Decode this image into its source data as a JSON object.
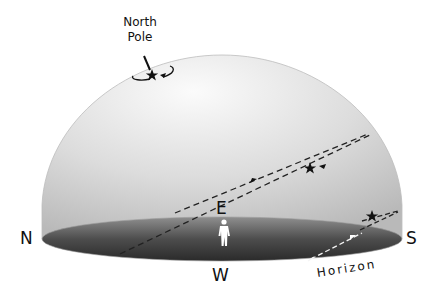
{
  "diagram": {
    "type": "celestial-sphere",
    "labels": {
      "north_pole": [
        "North",
        "Pole"
      ],
      "north": "N",
      "south": "S",
      "east": "E",
      "west": "W",
      "horizon": "Horizon"
    },
    "elements": [
      {
        "id": "sky-dome",
        "description": "hemispherical sky dome over observer"
      },
      {
        "id": "horizon-plane",
        "description": "dark elliptical horizon disk"
      },
      {
        "id": "observer",
        "description": "white human figure at center"
      },
      {
        "id": "pole-star",
        "description": "star near north celestial pole with small circular arrow"
      },
      {
        "id": "star-path-high",
        "description": "dashed diurnal path loop with star, rising and setting arrows"
      },
      {
        "id": "star-path-low",
        "description": "dashed path near southern horizon with star, dipping below horizon"
      }
    ],
    "colors": {
      "dome_light": "#f2f2f2",
      "dome_mid": "#c9c9c9",
      "horizon_dark": "#3a3a3a",
      "horizon_edge": "#8a8a8a",
      "ink": "#111111"
    }
  }
}
